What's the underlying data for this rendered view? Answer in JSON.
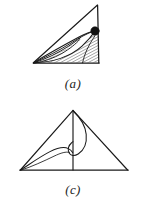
{
  "figure": {
    "background_color": "#ffffff",
    "ink_color": "#1a1a1a",
    "panel_count": 2
  },
  "panels": [
    {
      "id": "a",
      "caption": "(a)",
      "shape": "right-triangle",
      "description": "Right triangle with apex at top right, right angle at bottom right, sharp vertex at lower left; a family of curves emanates from the lower-left vertex, two lens shaped regions are filled with diagonal hatching, and a filled round marker sits on the right vertical edge.",
      "triangle": {
        "vertex_left": [
          33,
          63
        ],
        "vertex_apex": [
          97,
          5
        ],
        "vertex_right": [
          99,
          63
        ]
      },
      "marker": {
        "name": "filled-dot",
        "center": [
          95,
          31
        ],
        "radius": 4.2,
        "fill": "#111111"
      },
      "hatching": {
        "angle_deg": 62,
        "spacing_px": 2.6,
        "line_width": 0.7,
        "regions": 2
      },
      "curve_count": 5
    },
    {
      "id": "c",
      "caption": "(c)",
      "shape": "isosceles-triangle",
      "description": "Broad isosceles triangle with apex at top centre; a vertical line drops from the apex to the base, a teardrop loop hangs from the apex on the right of that line, and a long shallow curve sweeps from the lower-left vertex up and across to meet the loop.",
      "triangle": {
        "vertex_left": [
          20,
          170
        ],
        "vertex_apex": [
          73,
          110
        ],
        "vertex_right": [
          128,
          170
        ]
      },
      "vertical_line": {
        "from": [
          73,
          110
        ],
        "to": [
          73,
          170
        ]
      },
      "loop": {
        "name": "teardrop-loop",
        "anchor": [
          73,
          110
        ],
        "max_width_x": 92,
        "bottom_y": 157
      },
      "sweep_curve": {
        "from": [
          20,
          170
        ],
        "to": [
          73,
          148
        ]
      }
    }
  ]
}
